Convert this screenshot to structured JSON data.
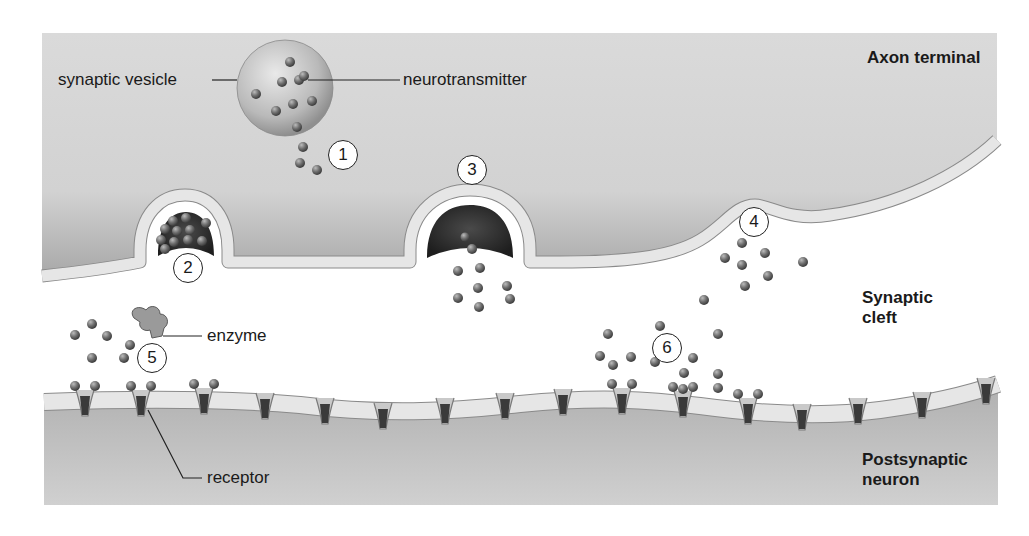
{
  "colors": {
    "axon_fill": "#d4d4d4",
    "axon_shadow": "#a9a9a9",
    "membrane": "#e6e6e6",
    "membrane_edge": "#8a8a8a",
    "post_fill": "#bdbdbd",
    "vesicle_dark": "#2e2e2e",
    "molecule": "#6a6a6a",
    "receptor": "#3a3a3a",
    "text": "#1a1a1a"
  },
  "region_labels": {
    "axon_terminal": "Axon terminal",
    "synaptic_cleft_1": "Synaptic",
    "synaptic_cleft_2": "cleft",
    "postsynaptic_1": "Postsynaptic",
    "postsynaptic_2": "neuron"
  },
  "callouts": {
    "synaptic_vesicle": "synaptic vesicle",
    "neurotransmitter": "neurotransmitter",
    "enzyme": "enzyme",
    "receptor": "receptor"
  },
  "steps": [
    {
      "n": "1",
      "x": 331,
      "y": 141
    },
    {
      "n": "2",
      "x": 174,
      "y": 252
    },
    {
      "n": "3",
      "x": 457,
      "y": 156
    },
    {
      "n": "4",
      "x": 739,
      "y": 207
    },
    {
      "n": "5",
      "x": 138,
      "y": 344
    },
    {
      "n": "6",
      "x": 652,
      "y": 333
    }
  ],
  "free_molecules": [
    [
      303,
      147
    ],
    [
      300,
      163
    ],
    [
      317,
      170
    ],
    [
      472,
      249
    ],
    [
      458,
      271
    ],
    [
      480,
      268
    ],
    [
      478,
      288
    ],
    [
      458,
      298
    ],
    [
      507,
      286
    ],
    [
      510,
      299
    ],
    [
      479,
      307
    ],
    [
      742,
      243
    ],
    [
      765,
      253
    ],
    [
      725,
      258
    ],
    [
      742,
      265
    ],
    [
      768,
      276
    ],
    [
      745,
      286
    ],
    [
      803,
      262
    ],
    [
      704,
      300
    ],
    [
      92,
      324
    ],
    [
      75,
      335
    ],
    [
      107,
      336
    ],
    [
      130,
      345
    ],
    [
      92,
      358
    ],
    [
      124,
      358
    ],
    [
      660,
      326
    ],
    [
      608,
      334
    ],
    [
      600,
      356
    ],
    [
      613,
      365
    ],
    [
      631,
      357
    ],
    [
      655,
      362
    ],
    [
      693,
      358
    ],
    [
      718,
      334
    ],
    [
      718,
      374
    ],
    [
      684,
      373
    ],
    [
      683,
      389
    ],
    [
      718,
      388
    ]
  ],
  "vesicle_molecules": [
    [
      290,
      62
    ],
    [
      282,
      82
    ],
    [
      299,
      80
    ],
    [
      304,
      76
    ],
    [
      276,
      111
    ],
    [
      293,
      104
    ],
    [
      312,
      101
    ],
    [
      297,
      127
    ],
    [
      256,
      94
    ]
  ],
  "bound_receptors": [
    {
      "x": 85,
      "y": 402
    },
    {
      "x": 141,
      "y": 402
    },
    {
      "x": 204,
      "y": 400
    },
    {
      "x": 622,
      "y": 400
    },
    {
      "x": 683,
      "y": 403
    },
    {
      "x": 748,
      "y": 410
    }
  ],
  "plain_receptors": [
    {
      "x": 265,
      "y": 405
    },
    {
      "x": 325,
      "y": 410
    },
    {
      "x": 383,
      "y": 415
    },
    {
      "x": 445,
      "y": 410
    },
    {
      "x": 505,
      "y": 405
    },
    {
      "x": 563,
      "y": 401
    },
    {
      "x": 802,
      "y": 416
    },
    {
      "x": 858,
      "y": 410
    },
    {
      "x": 922,
      "y": 404
    },
    {
      "x": 986,
      "y": 390
    }
  ]
}
